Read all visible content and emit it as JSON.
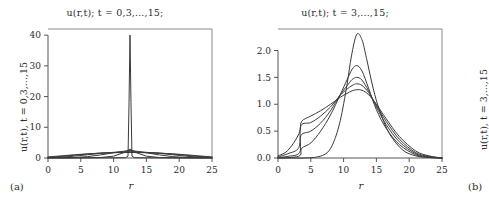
{
  "figure": {
    "panels": [
      {
        "tag": "(a)",
        "title": "u(r,t); t = 0,3,...,15;",
        "ylabel": "u(r,t), t = 0,3,...,15",
        "xlabel": "r"
      },
      {
        "tag": "(b)",
        "title": "u(r,t); t = 3,...,15;",
        "ylabel": "u(r,t), t = 3,...,15",
        "xlabel": "r"
      }
    ]
  },
  "chart_data": [
    {
      "type": "line",
      "panel": "(a)",
      "title": "u(r,t); t = 0,3,...,15;",
      "xlabel": "r",
      "ylabel": "u(r,t), t = 0,3,...,15",
      "xlim": [
        0,
        25
      ],
      "ylim": [
        0,
        42
      ],
      "xticks": [
        0,
        5,
        10,
        15,
        20,
        25
      ],
      "yticks": [
        0,
        10,
        20,
        30,
        40
      ],
      "grid": false,
      "legend": false,
      "note": "Initial condition t=0 is a tall narrow spike at r=12.5 reaching 40; later times t=3..15 are low broad bumps near 2-3.",
      "series": [
        {
          "name": "t = 0",
          "x": [
            0,
            6,
            10,
            11.8,
            12.2,
            12.35,
            12.5,
            12.65,
            12.8,
            13.2,
            15,
            19,
            25
          ],
          "y": [
            0.05,
            0.05,
            0.07,
            0.1,
            0.6,
            18,
            40,
            18,
            0.6,
            0.1,
            0.07,
            0.05,
            0.05
          ]
        },
        {
          "name": "t = 3",
          "x": [
            0,
            2,
            4,
            6,
            8,
            10,
            11.5,
            12.5,
            13.5,
            15,
            17,
            19,
            21,
            23,
            25
          ],
          "y": [
            0.05,
            0.05,
            0.06,
            0.08,
            0.15,
            0.6,
            1.7,
            2.9,
            1.7,
            0.6,
            0.15,
            0.08,
            0.06,
            0.05,
            0.05
          ]
        },
        {
          "name": "t = 6",
          "x": [
            0,
            2,
            4,
            6,
            8,
            10,
            11.5,
            12.5,
            13.5,
            15,
            17,
            19,
            21,
            23,
            25
          ],
          "y": [
            0.06,
            0.08,
            0.15,
            0.45,
            1.0,
            1.7,
            2.2,
            2.45,
            2.2,
            1.7,
            1.0,
            0.45,
            0.15,
            0.08,
            0.06
          ]
        },
        {
          "name": "t = 9",
          "x": [
            0,
            2,
            4,
            6,
            8,
            10,
            11.5,
            12.5,
            13.5,
            15,
            17,
            19,
            21,
            23,
            25
          ],
          "y": [
            0.1,
            0.25,
            0.6,
            1.05,
            1.5,
            1.85,
            2.0,
            2.05,
            2.0,
            1.85,
            1.5,
            1.05,
            0.6,
            0.25,
            0.1
          ]
        },
        {
          "name": "t = 12",
          "x": [
            0,
            2,
            4,
            6,
            8,
            10,
            11.5,
            12.5,
            13.5,
            15,
            17,
            19,
            21,
            23,
            25
          ],
          "y": [
            0.2,
            0.5,
            0.9,
            1.3,
            1.6,
            1.8,
            1.88,
            1.9,
            1.88,
            1.8,
            1.6,
            1.3,
            0.9,
            0.5,
            0.2
          ]
        },
        {
          "name": "t = 15",
          "x": [
            0,
            2,
            4,
            6,
            8,
            10,
            11.5,
            12.5,
            13.5,
            15,
            17,
            19,
            21,
            23,
            25
          ],
          "y": [
            0.35,
            0.7,
            1.05,
            1.35,
            1.58,
            1.72,
            1.77,
            1.8,
            1.77,
            1.72,
            1.58,
            1.35,
            1.05,
            0.7,
            0.35
          ]
        }
      ]
    },
    {
      "type": "line",
      "panel": "(b)",
      "title": "u(r,t); t = 3,...,15;",
      "xlabel": "r",
      "ylabel": "u(r,t), t = 3,...,15",
      "xlim": [
        0,
        25
      ],
      "ylim": [
        0,
        2.4
      ],
      "xticks": [
        0,
        5,
        10,
        15,
        20,
        25
      ],
      "yticks": [
        0.0,
        0.5,
        1.0,
        1.5,
        2.0
      ],
      "ytick_labels": [
        "0.0",
        "0.5",
        "1.0",
        "1.5",
        "2.0"
      ],
      "grid": false,
      "legend": false,
      "note": "Five right-skewed pulses peaking near r=12; peak heights decay from 2.3 down to 1.25 as t increases, while the left tail spreads toward r=0.",
      "series": [
        {
          "name": "t = 3",
          "peak_x": 12.0,
          "peak_y": 2.3,
          "x": [
            0,
            2,
            4,
            6,
            7.5,
            8.5,
            9.5,
            10.5,
            11.2,
            12.0,
            12.8,
            13.5,
            14.5,
            15.5,
            17,
            19,
            21,
            23,
            25
          ],
          "y": [
            0.0,
            0.0,
            0.0,
            0.02,
            0.1,
            0.3,
            0.7,
            1.35,
            1.9,
            2.3,
            2.2,
            1.85,
            1.3,
            0.88,
            0.45,
            0.15,
            0.04,
            0.01,
            0.0
          ]
        },
        {
          "name": "t = 6",
          "peak_x": 12.0,
          "peak_y": 1.72,
          "x": [
            0,
            2,
            3.4,
            3.6,
            5,
            6.5,
            8,
            9.5,
            10.5,
            11.3,
            12.0,
            12.8,
            13.8,
            15,
            16.5,
            18.5,
            21,
            23,
            25
          ],
          "y": [
            0.0,
            0.01,
            0.05,
            0.18,
            0.28,
            0.5,
            0.8,
            1.18,
            1.45,
            1.65,
            1.72,
            1.62,
            1.3,
            0.9,
            0.55,
            0.25,
            0.06,
            0.01,
            0.0
          ]
        },
        {
          "name": "t = 9",
          "peak_x": 12.0,
          "peak_y": 1.5,
          "x": [
            0,
            1.5,
            3.3,
            3.5,
            5,
            6.5,
            8,
            9.5,
            10.5,
            11.3,
            12.0,
            12.8,
            13.8,
            15,
            16.5,
            18.5,
            21,
            23,
            25
          ],
          "y": [
            0.01,
            0.03,
            0.1,
            0.42,
            0.5,
            0.65,
            0.88,
            1.18,
            1.34,
            1.46,
            1.5,
            1.45,
            1.25,
            0.95,
            0.62,
            0.3,
            0.08,
            0.02,
            0.0
          ]
        },
        {
          "name": "t = 12",
          "peak_x": 12.0,
          "peak_y": 1.38,
          "x": [
            0,
            1.5,
            3.2,
            3.5,
            5,
            6.5,
            8,
            9.5,
            10.5,
            11.3,
            12.0,
            12.8,
            13.8,
            15,
            16.5,
            18.5,
            21,
            23,
            25
          ],
          "y": [
            0.02,
            0.08,
            0.2,
            0.6,
            0.66,
            0.78,
            0.95,
            1.17,
            1.28,
            1.35,
            1.38,
            1.35,
            1.22,
            0.98,
            0.68,
            0.35,
            0.1,
            0.03,
            0.0
          ]
        },
        {
          "name": "t = 15",
          "peak_x": 12.0,
          "peak_y": 1.27,
          "x": [
            0,
            1.5,
            3.2,
            3.6,
            5,
            6.5,
            8,
            9.5,
            10.5,
            11.3,
            12.0,
            12.8,
            13.8,
            15,
            16.5,
            18.5,
            21,
            23,
            25
          ],
          "y": [
            0.04,
            0.14,
            0.45,
            0.68,
            0.78,
            0.88,
            1.0,
            1.13,
            1.2,
            1.25,
            1.27,
            1.26,
            1.18,
            1.0,
            0.73,
            0.4,
            0.13,
            0.04,
            0.0
          ]
        }
      ]
    }
  ]
}
